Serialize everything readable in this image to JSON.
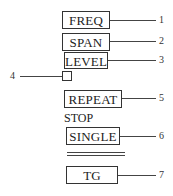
{
  "buttons": [
    {
      "label": "FREQ",
      "callout": "1"
    },
    {
      "label": "SPAN",
      "callout": "2"
    },
    {
      "label": "LEVEL",
      "callout": "3"
    },
    {
      "label": "REPEAT",
      "callout": "5"
    },
    {
      "label": "SINGLE",
      "callout": "6"
    },
    {
      "label": "TG",
      "callout": "7"
    }
  ],
  "indicator": {
    "callout": "4"
  },
  "stop_label": "STOP"
}
